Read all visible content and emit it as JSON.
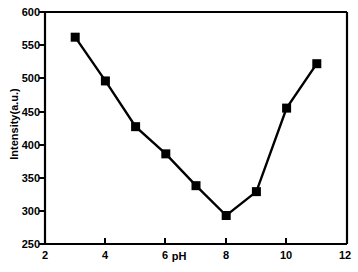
{
  "chart_data": {
    "type": "line",
    "title": "",
    "subtitle": "",
    "xlabel": "pH",
    "ylabel": "Intensity(a.u.)",
    "xlim": [
      2,
      12
    ],
    "ylim": [
      250,
      600
    ],
    "xticks": [
      2,
      4,
      6,
      8,
      10,
      12
    ],
    "yticks": [
      250,
      300,
      350,
      400,
      450,
      500,
      550,
      600
    ],
    "xticklabels": [
      "2",
      "4",
      "6",
      "8",
      "10",
      "12"
    ],
    "yticklabels": [
      "250",
      "300",
      "350",
      "400",
      "450",
      "500",
      "550",
      "600"
    ],
    "grid": false,
    "legend": null,
    "legend_position": "none",
    "marker": "square",
    "marker_color": "#000000",
    "line_color": "#000000",
    "x": [
      3,
      4,
      5,
      6,
      7,
      8,
      9,
      10,
      11
    ],
    "values": [
      562,
      496,
      427,
      386,
      338,
      293,
      329,
      455,
      522
    ],
    "series": [
      {
        "name": "Intensity",
        "x": [
          3,
          4,
          5,
          6,
          7,
          8,
          9,
          10,
          11
        ],
        "values": [
          562,
          496,
          427,
          386,
          338,
          293,
          329,
          455,
          522
        ]
      }
    ],
    "annotations": []
  },
  "axes": {
    "x_title": "pH",
    "y_title": "Intensity(a.u.)"
  },
  "ticks": {
    "y": [
      {
        "label": "600",
        "value": 600
      },
      {
        "label": "550",
        "value": 550
      },
      {
        "label": "500",
        "value": 500
      },
      {
        "label": "450",
        "value": 450
      },
      {
        "label": "400",
        "value": 400
      },
      {
        "label": "350",
        "value": 350
      },
      {
        "label": "300",
        "value": 300
      },
      {
        "label": "250",
        "value": 250
      }
    ],
    "x": [
      {
        "label": "2",
        "value": 2
      },
      {
        "label": "4",
        "value": 4
      },
      {
        "label": "6",
        "value": 6
      },
      {
        "label": "8",
        "value": 8
      },
      {
        "label": "10",
        "value": 10
      },
      {
        "label": "12",
        "value": 12
      }
    ]
  },
  "colors": {
    "background": "#ffffff",
    "foreground": "#000000",
    "series": "#000000"
  }
}
